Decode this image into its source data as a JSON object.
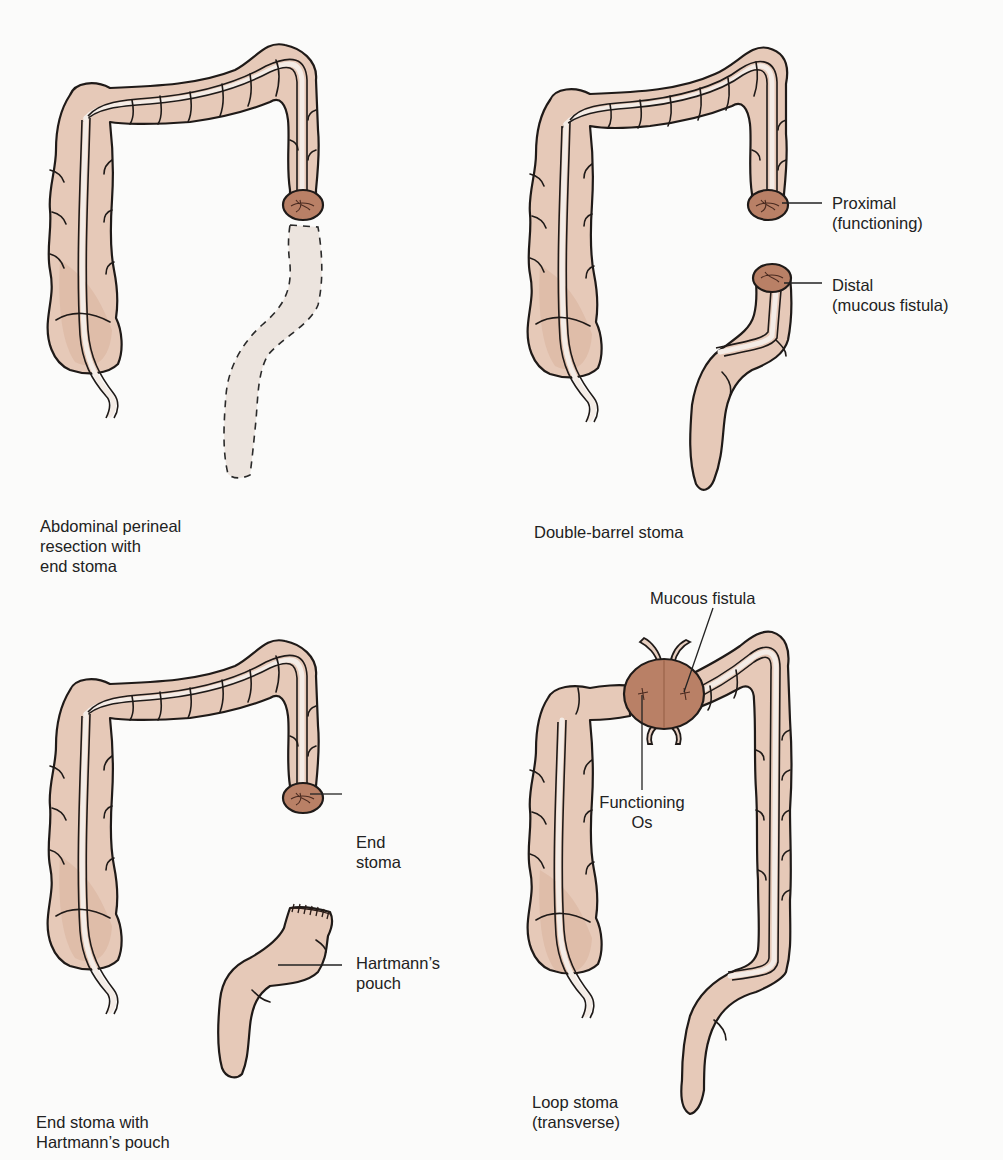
{
  "figure": {
    "panels": [
      {
        "id": "abdominal-perineal",
        "caption": "Abdominal perineal\nresection with\nend stoma",
        "callouts": []
      },
      {
        "id": "double-barrel",
        "caption": "Double-barrel stoma",
        "callouts": [
          {
            "label": "Proximal\n(functioning)"
          },
          {
            "label": "Distal\n(mucous fistula)"
          }
        ]
      },
      {
        "id": "hartmann",
        "caption": "End stoma with\nHartmann’s pouch",
        "callouts": [
          {
            "label": "End\nstoma"
          },
          {
            "label": "Hartmann’s\npouch"
          }
        ]
      },
      {
        "id": "loop",
        "caption": "Loop stoma\n(transverse)",
        "callouts": [
          {
            "label": "Mucous fistula"
          },
          {
            "label": "Functioning\nOs"
          }
        ]
      }
    ],
    "colors": {
      "colon": "#e6c9b8",
      "stoma": "#b98066",
      "outline": "#1f1a18",
      "removed_segment": "#ece4de",
      "background": "#fbfbfa"
    }
  }
}
